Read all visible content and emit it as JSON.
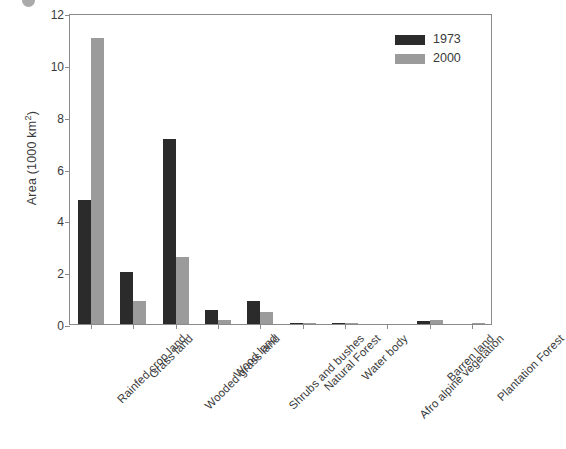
{
  "chart_data": {
    "type": "bar",
    "title": "",
    "xlabel": "",
    "ylabel": "Area (1000 km2)",
    "ylabel_prefix": "Area (1000 km",
    "ylabel_sup": "2",
    "ylabel_suffix": ")",
    "ylim": [
      0,
      12
    ],
    "yticks": [
      0,
      2,
      4,
      6,
      8,
      10,
      12
    ],
    "ytick_labels": [
      "0",
      "2",
      "4",
      "6",
      "8",
      "10",
      "12"
    ],
    "grid": false,
    "legend_position": "top-right",
    "categories": [
      "Rainfed crop land",
      "Grass land",
      "Wooded grass land",
      "Wood land",
      "Shrubs and bushes",
      "Natural Forest",
      "Water body",
      "Afro alpine vegetation",
      "Barren land",
      "Plantation Forest"
    ],
    "series": [
      {
        "name": "1973",
        "color": "#2b2b2b",
        "values": [
          4.8,
          2.0,
          7.15,
          0.55,
          0.9,
          0.03,
          0.02,
          0.0,
          0.1,
          0.0
        ]
      },
      {
        "name": "2000",
        "color": "#9b9b9b",
        "values": [
          11.05,
          0.9,
          2.6,
          0.15,
          0.45,
          0.02,
          0.02,
          0.0,
          0.17,
          0.02
        ]
      }
    ]
  },
  "legend": {
    "items": [
      {
        "label": "1973",
        "color": "#2b2b2b"
      },
      {
        "label": "2000",
        "color": "#9b9b9b"
      }
    ]
  },
  "colors": {
    "series_1973": "#2b2b2b",
    "series_2000": "#9b9b9b",
    "axis": "#8a8a8a",
    "text": "#3a3a3a",
    "background": "#ffffff"
  }
}
